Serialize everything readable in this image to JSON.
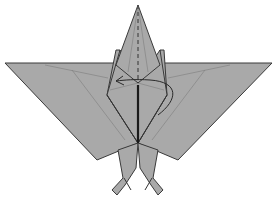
{
  "diagram": {
    "colors": {
      "paper": "#a9a9a9",
      "edge": "#333333",
      "crease": "#7d7d7d",
      "background": "#ffffff"
    },
    "symbols": [
      {
        "name": "valley-fold-line",
        "description": "dashed vertical line through head/neck"
      },
      {
        "name": "fold-arrow",
        "description": "curved arrow looping around neck from right wing to left"
      }
    ]
  }
}
